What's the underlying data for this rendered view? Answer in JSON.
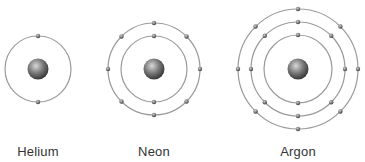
{
  "atoms": [
    {
      "name": "Helium",
      "cx": 38,
      "cy": 69,
      "shells": [
        {
          "r": 33,
          "electrons": 2
        }
      ]
    },
    {
      "name": "Neon",
      "cx": 154,
      "cy": 69,
      "shells": [
        {
          "r": 33,
          "electrons": 2
        },
        {
          "r": 46,
          "electrons": 8
        }
      ]
    },
    {
      "name": "Argon",
      "cx": 298,
      "cy": 69,
      "shells": [
        {
          "r": 34,
          "electrons": 2
        },
        {
          "r": 47,
          "electrons": 8
        },
        {
          "r": 60,
          "electrons": 8
        }
      ]
    }
  ],
  "colors": {
    "orbit": "#9a9a9a",
    "nucleus": "#5a5a5a",
    "electron": "#555555",
    "text": "#333333"
  }
}
